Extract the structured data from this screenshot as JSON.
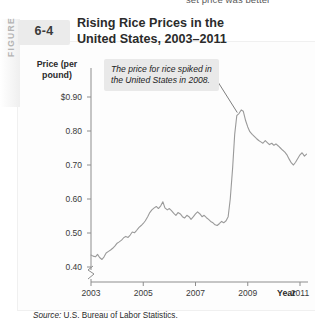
{
  "page": {
    "bleed_text_above": "set price was better"
  },
  "figure": {
    "tab_label": "FIGURE",
    "number": "6-4",
    "title": "Rising Rice Prices in the United States, 2003–2011",
    "title_line1": "Rising Rice Prices in the",
    "title_line2": "United States, 2003–2011",
    "callout": "The price for rice spiked in the United States in 2008.",
    "source_prefix": "Source:",
    "source_text": "U.S. Bureau of Labor Statistics.",
    "line_color": "#9a9a9a",
    "callout_bg": "#e9e9e9"
  },
  "chart_data": {
    "type": "line",
    "title": "Rising Rice Prices in the United States, 2003–2011",
    "xlabel": "Year",
    "ylabel": "Price (per pound)",
    "xlim": [
      2003,
      2011.4
    ],
    "ylim": [
      0.38,
      0.95
    ],
    "y_axis_break": true,
    "grid": false,
    "legend": "none",
    "ytick_labels": [
      "0.40",
      "0.50",
      "0.60",
      "0.70",
      "0.80",
      "$0.90"
    ],
    "ytick_values": [
      0.4,
      0.5,
      0.6,
      0.7,
      0.8,
      0.9
    ],
    "xtick_labels": [
      "2003",
      "2005",
      "2007",
      "2009",
      "2011"
    ],
    "xtick_values": [
      2003,
      2005,
      2007,
      2009,
      2011
    ],
    "annotations": [
      {
        "text": "The price for rice spiked in the United States in 2008.",
        "points_to_x": 2008.6,
        "points_to_y": 0.86
      }
    ],
    "series": [
      {
        "name": "Rice price (per pound)",
        "x": [
          2003.0,
          2003.08,
          2003.17,
          2003.25,
          2003.33,
          2003.42,
          2003.5,
          2003.58,
          2003.67,
          2003.75,
          2003.83,
          2003.92,
          2004.0,
          2004.08,
          2004.17,
          2004.25,
          2004.33,
          2004.42,
          2004.5,
          2004.58,
          2004.67,
          2004.75,
          2004.83,
          2004.92,
          2005.0,
          2005.08,
          2005.17,
          2005.25,
          2005.33,
          2005.42,
          2005.5,
          2005.58,
          2005.67,
          2005.75,
          2005.83,
          2005.92,
          2006.0,
          2006.08,
          2006.17,
          2006.25,
          2006.33,
          2006.42,
          2006.5,
          2006.58,
          2006.67,
          2006.75,
          2006.83,
          2006.92,
          2007.0,
          2007.08,
          2007.17,
          2007.25,
          2007.33,
          2007.42,
          2007.5,
          2007.58,
          2007.67,
          2007.75,
          2007.83,
          2007.92,
          2008.0,
          2008.08,
          2008.17,
          2008.25,
          2008.33,
          2008.42,
          2008.5,
          2008.58,
          2008.67,
          2008.75,
          2008.83,
          2008.92,
          2009.0,
          2009.08,
          2009.17,
          2009.25,
          2009.33,
          2009.42,
          2009.5,
          2009.58,
          2009.67,
          2009.75,
          2009.83,
          2009.92,
          2010.0,
          2010.08,
          2010.17,
          2010.25,
          2010.33,
          2010.42,
          2010.5,
          2010.58,
          2010.67,
          2010.75,
          2010.83,
          2010.92,
          2011.0,
          2011.08,
          2011.17,
          2011.25
        ],
        "y": [
          0.435,
          0.432,
          0.43,
          0.437,
          0.428,
          0.422,
          0.43,
          0.441,
          0.446,
          0.45,
          0.455,
          0.462,
          0.47,
          0.474,
          0.479,
          0.486,
          0.49,
          0.487,
          0.494,
          0.503,
          0.501,
          0.508,
          0.516,
          0.522,
          0.528,
          0.536,
          0.548,
          0.56,
          0.568,
          0.574,
          0.578,
          0.572,
          0.58,
          0.592,
          0.574,
          0.568,
          0.572,
          0.566,
          0.558,
          0.552,
          0.56,
          0.556,
          0.548,
          0.544,
          0.552,
          0.548,
          0.54,
          0.548,
          0.556,
          0.562,
          0.556,
          0.548,
          0.552,
          0.545,
          0.54,
          0.534,
          0.53,
          0.524,
          0.522,
          0.528,
          0.534,
          0.53,
          0.536,
          0.548,
          0.6,
          0.69,
          0.79,
          0.845,
          0.852,
          0.862,
          0.858,
          0.83,
          0.812,
          0.798,
          0.79,
          0.784,
          0.778,
          0.772,
          0.768,
          0.764,
          0.772,
          0.766,
          0.76,
          0.764,
          0.758,
          0.762,
          0.756,
          0.75,
          0.744,
          0.738,
          0.73,
          0.718,
          0.706,
          0.7,
          0.708,
          0.72,
          0.73,
          0.736,
          0.726,
          0.732
        ]
      }
    ]
  }
}
